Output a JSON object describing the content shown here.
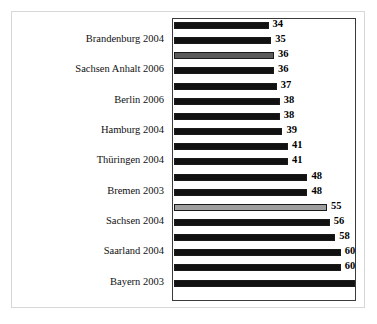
{
  "chart_data": {
    "type": "bar",
    "orientation": "horizontal",
    "title": "",
    "xlabel": "",
    "ylabel": "",
    "xlim": [
      0,
      66
    ],
    "grid": false,
    "legend": null,
    "categories": [
      "",
      "Brandenburg 2004",
      "",
      "Sachsen Anhalt 2006",
      "",
      "Berlin  2006",
      "",
      "Hamburg 2004",
      "",
      "Thüringen 2004",
      "",
      "Bremen 2003",
      "",
      "Sachsen 2004",
      "",
      "Saarland 2004",
      "",
      "Bayern 2003"
    ],
    "values": [
      34,
      35,
      36,
      36,
      37,
      38,
      38,
      39,
      41,
      41,
      48,
      48,
      55,
      56,
      58,
      60,
      60,
      65
    ],
    "bars": [
      {
        "value": 34,
        "label": "34",
        "tone": "dark",
        "category": ""
      },
      {
        "value": 35,
        "label": "35",
        "tone": "dark",
        "category": "Brandenburg 2004"
      },
      {
        "value": 36,
        "label": "36",
        "tone": "mid",
        "category": ""
      },
      {
        "value": 36,
        "label": "36",
        "tone": "dark",
        "category": "Sachsen Anhalt 2006"
      },
      {
        "value": 37,
        "label": "37",
        "tone": "dark",
        "category": ""
      },
      {
        "value": 38,
        "label": "38",
        "tone": "dark",
        "category": "Berlin  2006"
      },
      {
        "value": 38,
        "label": "38",
        "tone": "dark",
        "category": ""
      },
      {
        "value": 39,
        "label": "39",
        "tone": "dark",
        "category": "Hamburg 2004"
      },
      {
        "value": 41,
        "label": "41",
        "tone": "dark",
        "category": ""
      },
      {
        "value": 41,
        "label": "41",
        "tone": "dark",
        "category": "Thüringen 2004"
      },
      {
        "value": 48,
        "label": "48",
        "tone": "dark",
        "category": ""
      },
      {
        "value": 48,
        "label": "48",
        "tone": "dark",
        "category": "Bremen 2003"
      },
      {
        "value": 55,
        "label": "55",
        "tone": "light",
        "category": ""
      },
      {
        "value": 56,
        "label": "56",
        "tone": "dark",
        "category": "Sachsen 2004"
      },
      {
        "value": 58,
        "label": "58",
        "tone": "dark",
        "category": ""
      },
      {
        "value": 60,
        "label": "60",
        "tone": "dark",
        "category": "Saarland 2004"
      },
      {
        "value": 60,
        "label": "60",
        "tone": "dark",
        "category": ""
      },
      {
        "value": 65,
        "label": "65",
        "tone": "dark",
        "category": "Bayern 2003"
      }
    ],
    "axis_labels": [
      "Brandenburg 2004",
      "Sachsen Anhalt 2006",
      "Berlin  2006",
      "Hamburg 2004",
      "Thüringen 2004",
      "Bremen 2003",
      "Sachsen 2004",
      "Saarland 2004",
      "Bayern 2003"
    ],
    "colors": {
      "bar_dark": "#111111",
      "bar_mid": "#5b5b5b",
      "bar_light": "#9e9e9e",
      "bar_outline": "#1a1a1a",
      "plot_border": "#3a3a3a",
      "outer_frame": "#d8d8d8",
      "background": "#ffffff",
      "text": "#000000"
    }
  },
  "caption": {
    "bottom_clipped_text": ""
  }
}
